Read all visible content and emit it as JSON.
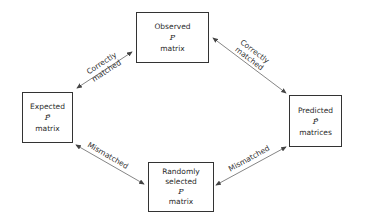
{
  "diagram": {
    "nodes": {
      "observed": {
        "line1": "Observed",
        "symbol": "P",
        "line3": "matrix"
      },
      "expected": {
        "line1": "Expected",
        "symbol": "P̃",
        "line3": "matrix"
      },
      "predicted": {
        "line1": "Predicted",
        "symbol": "P̂",
        "line3": "matrices"
      },
      "random": {
        "line1": "Randomly",
        "line2": "selected",
        "symbol": "P",
        "line3": "matrix"
      }
    },
    "edges": {
      "expected_observed": {
        "line1": "Correctly",
        "line2": "matched",
        "direction": "bidirectional"
      },
      "observed_predicted": {
        "line1": "Correctly",
        "line2": "matched",
        "direction": "bidirectional"
      },
      "expected_random": {
        "line1": "Mismatched",
        "direction": "bidirectional"
      },
      "random_predicted": {
        "line1": "Mismatched",
        "direction": "bidirectional"
      }
    },
    "colors": {
      "line": "#555555",
      "text": "#2a2a2a"
    }
  }
}
